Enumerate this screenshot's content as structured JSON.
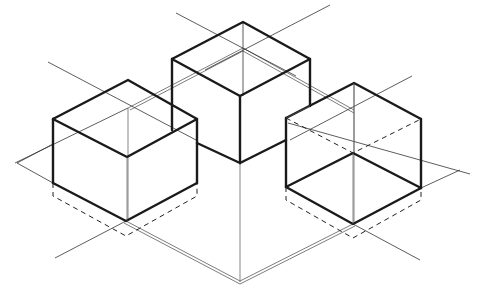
{
  "figure": {
    "title": "Isometric drawing of three cubes with construction lines",
    "colors": {
      "background": "#ffffff",
      "line": "#1a1a1a",
      "construction": "#444444"
    },
    "cubes": [
      {
        "name": "left-cube",
        "top": [
          128,
          80
        ],
        "left": [
          53,
          119
        ],
        "right": [
          197,
          119
        ],
        "front": [
          127,
          157
        ],
        "bottom_left": [
          53,
          183
        ],
        "bottom_front": [
          126,
          221
        ],
        "bottom_right": [
          197,
          183
        ]
      },
      {
        "name": "center-cube",
        "top": [
          243,
          22
        ],
        "left": [
          172,
          59
        ],
        "right": [
          310,
          59
        ],
        "front": [
          240,
          96
        ],
        "bottom_left": [
          172,
          130
        ],
        "bottom_front": [
          240,
          163
        ],
        "bottom_right": [
          310,
          128
        ]
      },
      {
        "name": "right-cube",
        "top": [
          354,
          83
        ],
        "left": [
          286,
          118
        ],
        "right": [
          421,
          119
        ],
        "front": [
          353,
          153
        ],
        "bottom_left": [
          286,
          187
        ],
        "bottom_front": [
          353,
          224
        ],
        "bottom_right": [
          421,
          188
        ]
      }
    ]
  }
}
